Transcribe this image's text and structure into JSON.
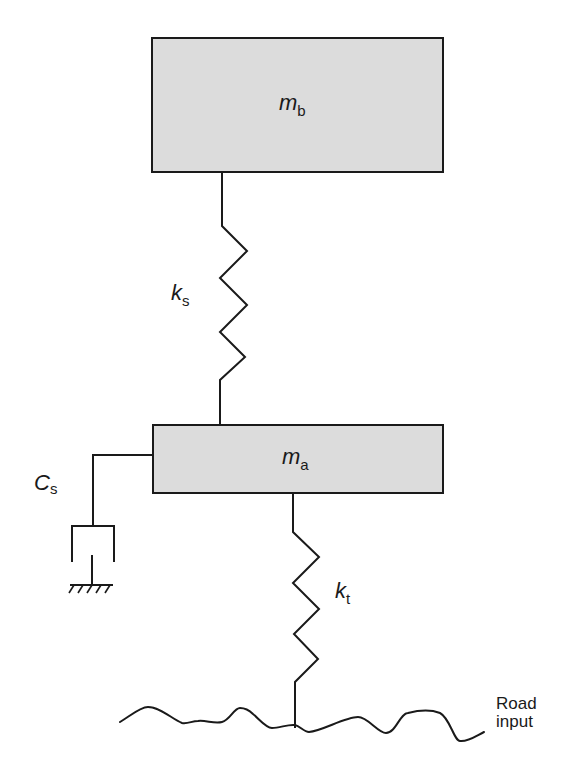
{
  "diagram": {
    "colors": {
      "mass_fill": "#dcdcdc",
      "stroke": "#1a1a1a",
      "background": "#ffffff"
    },
    "components": {
      "sprung_mass": {
        "symbol": "m",
        "subscript": "b"
      },
      "unsprung_mass": {
        "symbol": "m",
        "subscript": "a"
      },
      "suspension_spring": {
        "symbol": "k",
        "subscript": "s"
      },
      "suspension_damper": {
        "symbol": "C",
        "subscript": "s"
      },
      "tire_spring": {
        "symbol": "k",
        "subscript": "t"
      }
    },
    "road": {
      "label_line1": "Road",
      "label_line2": "input"
    }
  }
}
